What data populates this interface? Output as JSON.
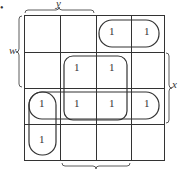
{
  "kmap": {
    "labels": {
      "top": "y",
      "left": "w",
      "right": "x",
      "bullet": "•"
    },
    "grid": [
      [
        "",
        "",
        "1",
        "1"
      ],
      [
        "",
        "1",
        "1",
        ""
      ],
      [
        "1",
        "1",
        "1",
        "1"
      ],
      [
        "1",
        "",
        "",
        ""
      ]
    ],
    "line_color": "#333333"
  }
}
